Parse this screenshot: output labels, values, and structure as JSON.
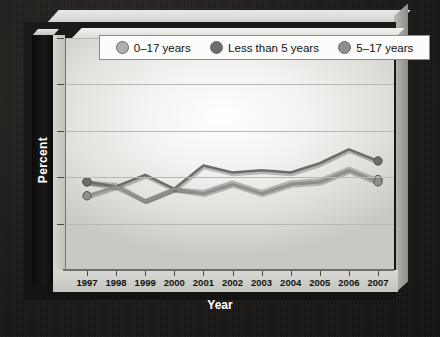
{
  "chart_data": {
    "type": "line",
    "title": "",
    "xlabel": "Year",
    "ylabel": "Percent",
    "categories": [
      "1997",
      "1998",
      "1999",
      "2000",
      "2001",
      "2002",
      "2003",
      "2004",
      "2005",
      "2006",
      "2007"
    ],
    "x": [
      1997,
      1998,
      1999,
      2000,
      2001,
      2002,
      2003,
      2004,
      2005,
      2006,
      2007
    ],
    "ylim": [
      0,
      10
    ],
    "yticks": [
      0,
      2,
      4,
      6,
      8,
      10
    ],
    "grid": true,
    "legend_position": "top",
    "series": [
      {
        "name": "0–17 years",
        "color": "#b0b0ac",
        "marker": "circle",
        "values": [
          3.8,
          3.7,
          3.0,
          3.5,
          3.4,
          3.8,
          3.4,
          3.8,
          3.9,
          4.4,
          3.9
        ]
      },
      {
        "name": "Less than 5 years",
        "color": "#6d6d6a",
        "marker": "circle",
        "values": [
          3.8,
          3.6,
          4.1,
          3.5,
          4.5,
          4.2,
          4.3,
          4.2,
          4.6,
          5.2,
          4.7
        ]
      },
      {
        "name": "5–17 years",
        "color": "#8e8e8a",
        "marker": "circle",
        "values": [
          3.2,
          3.6,
          3.0,
          3.5,
          3.3,
          3.7,
          3.3,
          3.7,
          3.8,
          4.3,
          3.8
        ]
      }
    ]
  },
  "axis": {
    "y_title": "Percent",
    "x_title": "Year",
    "y_tick_labels": [
      "10",
      "8",
      "6",
      "4",
      "2",
      "0"
    ],
    "x_tick_labels": [
      "1997",
      "1998",
      "1999",
      "2000",
      "2001",
      "2002",
      "2003",
      "2004",
      "2005",
      "2006",
      "2007"
    ]
  },
  "legend": {
    "items": [
      {
        "label": "0–17 years",
        "color": "#b0b0ac"
      },
      {
        "label": "Less than 5 years",
        "color": "#6d6d6a"
      },
      {
        "label": "5–17 years",
        "color": "#8e8e8a"
      }
    ]
  },
  "colors": {
    "background": "#1a1817",
    "panel": "#f2f2f0",
    "grid": "#b8b8b3",
    "axis_text": "#111111",
    "title_text": "#ffffff"
  }
}
